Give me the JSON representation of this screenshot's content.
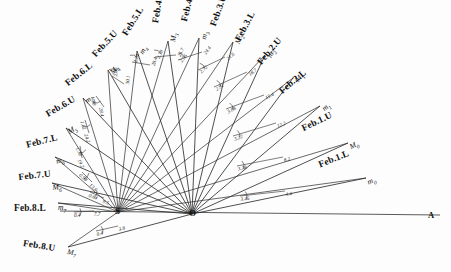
{
  "figure": {
    "background_color": "#fdfdfd",
    "ink_color": "#232323",
    "baseline_color": "#5c5c5c"
  },
  "origins": [
    {
      "name": "S",
      "label": "S",
      "x": 118,
      "y": 212
    },
    {
      "name": "O",
      "label": "O",
      "x": 192,
      "y": 214
    }
  ],
  "endpoint": {
    "label": "A",
    "x": 430,
    "y": 216
  },
  "date_labels": [
    {
      "label": "Feb.1.L",
      "point": "m0",
      "x": 317,
      "y": 160,
      "rot": -22
    },
    {
      "label": "Feb.1.U",
      "point": "M0",
      "x": 300,
      "y": 124,
      "rot": -26
    },
    {
      "label": "Feb.2.L",
      "point": "m1",
      "x": 277,
      "y": 88,
      "rot": -40
    },
    {
      "label": "Feb.2.U",
      "point": "M1",
      "x": 255,
      "y": 60,
      "rot": -50
    },
    {
      "label": "Feb.3.L",
      "point": "m2",
      "x": 233,
      "y": 38,
      "rot": -62
    },
    {
      "label": "Feb.3.U",
      "point": "M2",
      "x": 208,
      "y": 24,
      "rot": -70
    },
    {
      "label": "Feb.4.L",
      "point": "m3",
      "x": 179,
      "y": 20,
      "rot": -76
    },
    {
      "label": "Feb.4.U",
      "point": "M3",
      "x": 150,
      "y": 22,
      "rot": -80
    },
    {
      "label": "Feb.5.L",
      "point": "m4",
      "x": 120,
      "y": 32,
      "rot": -58
    },
    {
      "label": "Feb.5.U",
      "point": "M4",
      "x": 90,
      "y": 52,
      "rot": -47
    },
    {
      "label": "Feb.6.L",
      "point": "m5",
      "x": 63,
      "y": 80,
      "rot": -38
    },
    {
      "label": "Feb.6.U",
      "point": "M5",
      "x": 44,
      "y": 110,
      "rot": -30
    },
    {
      "label": "Feb.7.L",
      "point": "m6",
      "x": 25,
      "y": 140,
      "rot": -14
    },
    {
      "label": "Feb.7.U",
      "point": "M6",
      "x": 18,
      "y": 172,
      "rot": -6
    },
    {
      "label": "Feb.8.L",
      "point": "m7",
      "x": 14,
      "y": 203,
      "rot": 0
    },
    {
      "label": "Feb.8.U",
      "point": "M7",
      "x": 24,
      "y": 238,
      "rot": 9
    }
  ],
  "point_labels": [
    {
      "label": "m",
      "sub": "0",
      "x": 366,
      "y": 178,
      "rot": -22
    },
    {
      "label": "M",
      "sub": "0",
      "x": 348,
      "y": 143,
      "rot": -26
    },
    {
      "label": "m",
      "sub": "1",
      "x": 320,
      "y": 106,
      "rot": -40
    },
    {
      "label": "M",
      "sub": "1",
      "x": 293,
      "y": 78,
      "rot": -50
    },
    {
      "label": "m",
      "sub": "2",
      "x": 265,
      "y": 55,
      "rot": -62
    },
    {
      "label": "M",
      "sub": "2",
      "x": 233,
      "y": 42,
      "rot": -70
    },
    {
      "label": "m",
      "sub": "3",
      "x": 199,
      "y": 38,
      "rot": -76
    },
    {
      "label": "M",
      "sub": "3",
      "x": 168,
      "y": 41,
      "rot": -80
    },
    {
      "label": "m",
      "sub": "4",
      "x": 137,
      "y": 51,
      "rot": -58
    },
    {
      "label": "M",
      "sub": "4",
      "x": 108,
      "y": 70,
      "rot": -47
    },
    {
      "label": "m",
      "sub": "5",
      "x": 83,
      "y": 98,
      "rot": -38
    },
    {
      "label": "M",
      "sub": "5",
      "x": 66,
      "y": 128,
      "rot": -30
    },
    {
      "label": "m",
      "sub": "6",
      "x": 55,
      "y": 157,
      "rot": -14
    },
    {
      "label": "M",
      "sub": "6",
      "x": 52,
      "y": 183,
      "rot": -6
    },
    {
      "label": "m",
      "sub": "7",
      "x": 58,
      "y": 203,
      "rot": 0
    },
    {
      "label": "M",
      "sub": "7",
      "x": 68,
      "y": 247,
      "rot": 9
    }
  ],
  "measurements": [
    {
      "inner": "3.46",
      "outer": "4.4",
      "ix": 240,
      "iy": 196,
      "ox": 285,
      "oy": 191,
      "rot": -8
    },
    {
      "inner": "3.38",
      "outer": "8.2",
      "ix": 237,
      "iy": 166,
      "ox": 283,
      "oy": 157,
      "rot": -14
    },
    {
      "inner": "3.22",
      "outer": "12.2",
      "ix": 233,
      "iy": 136,
      "ox": 276,
      "oy": 123,
      "rot": -20
    },
    {
      "inner": "3.08",
      "outer": "15.4",
      "ix": 226,
      "iy": 109,
      "ox": 264,
      "oy": 95,
      "rot": -27
    },
    {
      "inner": "2.92",
      "outer": "18.7",
      "ix": 214,
      "iy": 87,
      "ox": 247,
      "oy": 72,
      "rot": -36
    },
    {
      "inner": "2.72",
      "outer": "21.6",
      "ix": 198,
      "iy": 70,
      "ox": 225,
      "oy": 57,
      "rot": -44
    },
    {
      "inner": "2.56",
      "outer": "24.4",
      "ix": 178,
      "iy": 60,
      "ox": 202,
      "oy": 52,
      "rot": -55
    },
    {
      "inner": "2.38",
      "outer": "26.7",
      "ix": 155,
      "iy": 57,
      "ox": 176,
      "oy": 55,
      "rot": -66
    },
    {
      "inner": "2.24",
      "outer": "28.4",
      "ix": 132,
      "iy": 62,
      "ox": 150,
      "oy": 65,
      "rot": -76
    },
    {
      "inner": "2.06",
      "outer": "30.1",
      "ix": 112,
      "iy": 76,
      "ox": 124,
      "oy": 84,
      "rot": -84
    },
    {
      "inner": "1.88",
      "outer": "28.4",
      "ix": 96,
      "iy": 96,
      "ox": 104,
      "oy": 107,
      "rot": 80
    },
    {
      "inner": "1.62",
      "outer": "24.2",
      "ix": 85,
      "iy": 120,
      "ox": 89,
      "oy": 133,
      "rot": 72
    },
    {
      "inner": "1.38",
      "outer": "19.2",
      "ix": 80,
      "iy": 146,
      "ox": 82,
      "oy": 158,
      "rot": 64
    },
    {
      "inner": "0.98",
      "outer": "13.6",
      "ix": 82,
      "iy": 172,
      "ox": 92,
      "oy": 182,
      "rot": 40
    },
    {
      "inner": "0.64",
      "outer": "9.5",
      "ix": 90,
      "iy": 192,
      "ox": 104,
      "oy": 198,
      "rot": 20
    },
    {
      "inner": "0.4",
      "outer": "7.7",
      "ix": 74,
      "iy": 212,
      "ox": 94,
      "oy": 211,
      "rot": 0
    },
    {
      "inner": "0.4",
      "outer": "3.8",
      "ix": 96,
      "iy": 231,
      "ox": 118,
      "oy": 226,
      "rot": -12
    }
  ]
}
